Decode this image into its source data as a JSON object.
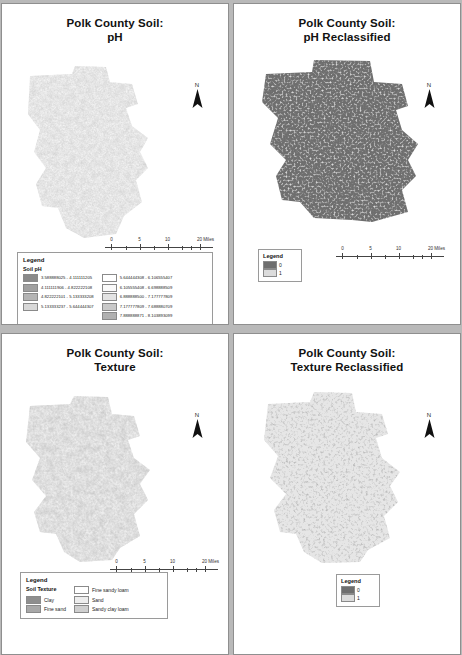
{
  "document": {
    "background_color": "#b9b9b9",
    "layout": "2x2 map series",
    "sheet_color": "#ffffff"
  },
  "panels": [
    {
      "id": "ph",
      "title_line1": "Polk County Soil:",
      "title_line2": "pH",
      "north_label": "N",
      "scalebar": {
        "labels": [
          "0",
          "5",
          "10",
          "20 Miles"
        ],
        "unit": "Miles"
      },
      "legend": {
        "title": "Legend",
        "subtitle": "Soil pH",
        "columns": [
          [
            {
              "label": "3.588888025 - 4.111111205",
              "color": "#8a8a8a"
            },
            {
              "label": "4.111111906 - 4.822222108",
              "color": "#a0a0a0"
            },
            {
              "label": "4.822222101 - 5.133333208",
              "color": "#b4b4b4"
            },
            {
              "label": "5.133333237 - 5.644444307",
              "color": "#d8d8d8"
            }
          ],
          [
            {
              "label": "5.644444308 - 6.106555407",
              "color": "#ffffff"
            },
            {
              "label": "6.105555408 - 6.698888509",
              "color": "#fafafa"
            },
            {
              "label": "6.888888500 - 7.177777809",
              "color": "#e3e3e3"
            },
            {
              "label": "7.177777809 - 7.688880709",
              "color": "#c9c9c9"
            },
            {
              "label": "7.888888871 - 8.103893099",
              "color": "#b0b0b0"
            }
          ]
        ]
      }
    },
    {
      "id": "ph-reclass",
      "title_line1": "Polk County Soil:",
      "title_line2": "pH Reclassified",
      "north_label": "N",
      "scalebar": {
        "labels": [
          "0",
          "5",
          "10",
          "20 Miles"
        ],
        "unit": "Miles"
      },
      "legend": {
        "title": "Legend",
        "items": [
          {
            "label": "0",
            "color": "#6e6e6e"
          },
          {
            "label": "1",
            "color": "#dcdcdc"
          }
        ]
      }
    },
    {
      "id": "texture",
      "title_line1": "Polk County Soil:",
      "title_line2": "Texture",
      "north_label": "N",
      "scalebar": {
        "labels": [
          "0",
          "5",
          "10",
          "20 Miles"
        ],
        "unit": "Miles"
      },
      "legend": {
        "title": "Legend",
        "subtitle": "Soil Texture",
        "columns": [
          [
            {
              "label": "Clay",
              "color": "#8e8e8e"
            },
            {
              "label": "Fine sand",
              "color": "#a8a8a8"
            }
          ],
          [
            {
              "label": "Fine sandy loam",
              "color": "#ffffff"
            },
            {
              "label": "Sand",
              "color": "#ededed"
            },
            {
              "label": "Sandy clay loam",
              "color": "#cfcfcf"
            }
          ]
        ]
      }
    },
    {
      "id": "texture-reclass",
      "title_line1": "Polk County Soil:",
      "title_line2": "Texture Reclassified",
      "north_label": "N",
      "legend": {
        "title": "Legend",
        "items": [
          {
            "label": "0",
            "color": "#6e6e6e"
          },
          {
            "label": "1",
            "color": "#dcdcdc"
          }
        ]
      }
    }
  ]
}
